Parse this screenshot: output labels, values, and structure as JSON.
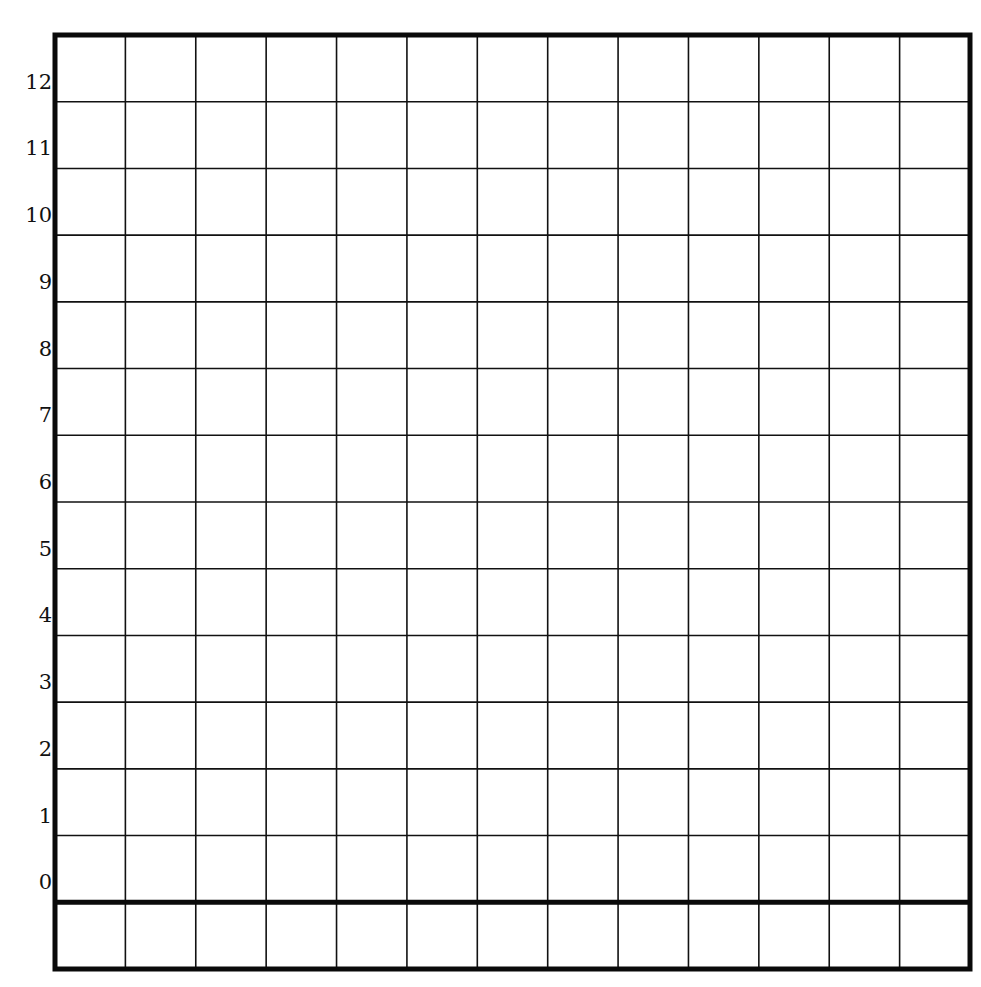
{
  "grid": {
    "columns": 13,
    "rows": 14,
    "left": 55,
    "right": 970,
    "top": 35,
    "bottom": 969,
    "thick_line_row_index": 13,
    "line_color": "#111111",
    "border_color": "#0a0a0a"
  },
  "y_axis": {
    "labels": [
      "12",
      "11",
      "10",
      "9",
      "8",
      "7",
      "6",
      "5",
      "4",
      "3",
      "2",
      "1",
      "0"
    ]
  }
}
